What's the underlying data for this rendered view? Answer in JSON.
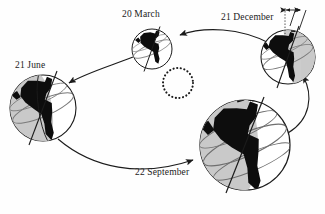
{
  "diagram": {
    "background_color": "#fefefe",
    "ink_color": "#1b1b1b",
    "shadow_color": "#c9c9c9",
    "land_color": "#0d0d0d",
    "width": 325,
    "height": 214
  },
  "sun": {
    "name": "sun",
    "representation": "dotted-circle",
    "cx": 178,
    "cy": 83,
    "r": 15,
    "dot_count": 26,
    "dot_radius": 1.05
  },
  "positions": [
    {
      "id": "march",
      "label": "20 March",
      "season_event": "March equinox",
      "cx": 152,
      "cy": 49,
      "r": 20,
      "axis_tilt_deg": -23.5,
      "lit_side": "right",
      "shadow_opacity": 0.0
    },
    {
      "id": "december",
      "label": "21 December",
      "season_event": "December solstice",
      "cx": 288,
      "cy": 57,
      "r": 27,
      "axis_tilt_deg": -23.5,
      "lit_side": "left",
      "shadow_opacity": 1.0
    },
    {
      "id": "june",
      "label": "21 June",
      "season_event": "June solstice",
      "cx": 43,
      "cy": 108,
      "r": 33,
      "axis_tilt_deg": -23.5,
      "lit_side": "right",
      "shadow_opacity": 1.0
    },
    {
      "id": "september",
      "label": "22 September",
      "season_event": "September equinox",
      "cx": 245,
      "cy": 145,
      "r": 45,
      "axis_tilt_deg": -23.5,
      "lit_side": "right",
      "shadow_opacity": 1.0
    }
  ],
  "orbit_arrows": [
    {
      "id": "december-to-march",
      "from": "december",
      "to": "march",
      "direction": "leftward"
    },
    {
      "id": "march-to-june",
      "from": "march",
      "to": "june",
      "direction": "down-left"
    },
    {
      "id": "june-to-september",
      "from": "june",
      "to": "september",
      "direction": "down-right"
    },
    {
      "id": "september-to-december",
      "from": "september",
      "to": "december",
      "direction": "upward"
    }
  ],
  "tilt_indicator": {
    "name": "axial-tilt-indicator",
    "attached_to": "december",
    "has_double_headed_arrow": true,
    "reference_line": "dotted-vertical",
    "axis_line": "tilted"
  }
}
